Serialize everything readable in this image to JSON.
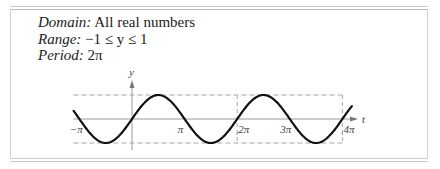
{
  "properties": [
    {
      "key": "Domain:",
      "value": "All real numbers"
    },
    {
      "key": "Range:",
      "value": "−1 ≤ y ≤ 1"
    },
    {
      "key": "Period:",
      "value": "2π"
    }
  ],
  "chart_data": {
    "type": "line",
    "function": "y = sin(t)",
    "xlabel": "t",
    "ylabel": "y",
    "x_range_radians": [
      -1.11,
      4.18
    ],
    "x_range_units": "multiples of pi",
    "ylim": [
      -1,
      1
    ],
    "x_ticks": [
      {
        "value": -1,
        "label": "−π"
      },
      {
        "value": 1,
        "label": "π"
      },
      {
        "value": 2,
        "label": "2π"
      },
      {
        "value": 3,
        "label": "3π"
      },
      {
        "value": 4,
        "label": "4π"
      }
    ],
    "guides": {
      "horizontal_dashed": [
        1,
        -1
      ],
      "vertical_dashed_x": [
        2,
        4
      ],
      "dashed_extent_x": [
        -1,
        4
      ]
    },
    "colors": {
      "curve": "#111111",
      "axis": "#9a9a9a",
      "guide": "#a8a8a8"
    }
  }
}
